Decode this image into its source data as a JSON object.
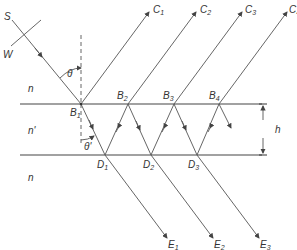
{
  "labels": {
    "source": "S",
    "wavefront": "W",
    "theta": "θ",
    "theta_prime": "θ'",
    "n_top": "n",
    "n_film": "n'",
    "n_bottom": "n",
    "thickness": "h",
    "B1": {
      "base": "B",
      "sub": "1"
    },
    "B2": {
      "base": "B",
      "sub": "2"
    },
    "B3": {
      "base": "B",
      "sub": "3"
    },
    "B4": {
      "base": "B",
      "sub": "4"
    },
    "D1": {
      "base": "D",
      "sub": "1"
    },
    "D2": {
      "base": "D",
      "sub": "2"
    },
    "D3": {
      "base": "D",
      "sub": "3"
    },
    "C1": {
      "base": "C",
      "sub": "1"
    },
    "C2": {
      "base": "C",
      "sub": "2"
    },
    "C3": {
      "base": "C",
      "sub": "3"
    },
    "C4": {
      "base": "C",
      "sub": "4"
    },
    "E1": {
      "base": "E",
      "sub": "1"
    },
    "E2": {
      "base": "E",
      "sub": "2"
    },
    "E3": {
      "base": "E",
      "sub": "3"
    }
  },
  "geometry": {
    "top_interface_y": 104,
    "bottom_interface_y": 155,
    "B_points": [
      [
        81,
        104
      ],
      [
        128,
        104
      ],
      [
        174,
        104
      ],
      [
        219,
        104
      ]
    ],
    "D_points": [
      [
        105,
        155
      ],
      [
        151,
        155
      ],
      [
        197,
        155
      ]
    ]
  }
}
